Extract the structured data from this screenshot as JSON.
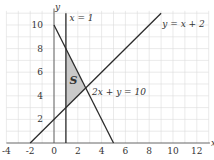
{
  "chart_data": {
    "type": "line",
    "title": "",
    "xlabel": "x",
    "ylabel": "y",
    "xlim": [
      -4,
      13
    ],
    "ylim": [
      -0.5,
      11
    ],
    "grid": true,
    "x_ticks": [
      -4,
      -2,
      0,
      2,
      4,
      6,
      8,
      10,
      12
    ],
    "y_ticks": [
      2,
      4,
      6,
      8,
      10
    ],
    "series": [
      {
        "name": "x = 1",
        "equation": "x = 1",
        "points": [
          [
            1,
            0
          ],
          [
            1,
            11
          ]
        ]
      },
      {
        "name": "y = x + 2",
        "equation": "y = x + 2",
        "points": [
          [
            -2,
            0
          ],
          [
            9,
            11
          ]
        ]
      },
      {
        "name": "2x + y = 10",
        "equation": "2x + y = 10",
        "points": [
          [
            0,
            10
          ],
          [
            5,
            0
          ]
        ]
      }
    ],
    "shaded_region": {
      "label": "S",
      "vertices": [
        [
          1,
          8
        ],
        [
          1,
          3
        ],
        [
          2.6667,
          4.6667
        ]
      ]
    },
    "annotations": [
      {
        "text": "x = 1",
        "at": [
          1.2,
          10.6
        ]
      },
      {
        "text": "y = x + 2",
        "at": [
          9.2,
          10.2
        ]
      },
      {
        "text": "2x + y = 10",
        "at": [
          3.2,
          4.0
        ]
      },
      {
        "text": "S",
        "at": [
          1.4,
          5.4
        ]
      }
    ]
  },
  "axes": {
    "x_label": "x",
    "y_label": "y"
  },
  "tick_labels": {
    "x": [
      "-4",
      "-2",
      "0",
      "2",
      "4",
      "6",
      "8",
      "10",
      "12"
    ],
    "y": [
      "2",
      "4",
      "6",
      "8",
      "10"
    ]
  },
  "labels": {
    "line_x1": "x = 1",
    "line_yx2": "y = x + 2",
    "line_2xy10": "2x + y = 10",
    "region": "S"
  },
  "colors": {
    "line": "#2b2b2b",
    "grid": "#d9d9d9",
    "region": "#c8c8c8"
  }
}
